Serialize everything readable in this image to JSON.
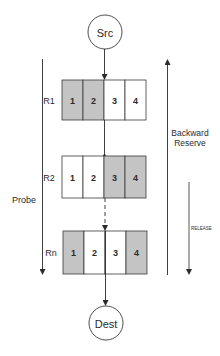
{
  "nodes": {
    "source": {
      "label": "Src"
    },
    "destination": {
      "label": "Dest"
    }
  },
  "routers": [
    {
      "label": "R1",
      "cells": [
        {
          "label": "1",
          "reserved": true
        },
        {
          "label": "2",
          "reserved": true
        },
        {
          "label": "3",
          "reserved": false
        },
        {
          "label": "4",
          "reserved": false
        }
      ]
    },
    {
      "label": "R2",
      "cells": [
        {
          "label": "1",
          "reserved": false
        },
        {
          "label": "2",
          "reserved": false
        },
        {
          "label": "3",
          "reserved": true
        },
        {
          "label": "4",
          "reserved": true
        }
      ]
    },
    {
      "label": "Rn",
      "cells": [
        {
          "label": "1",
          "reserved": true
        },
        {
          "label": "2",
          "reserved": false
        },
        {
          "label": "3",
          "reserved": false
        },
        {
          "label": "4",
          "reserved": true
        }
      ]
    }
  ],
  "arrows": {
    "probe": {
      "label": "Probe",
      "direction": "down"
    },
    "backward_reserve": {
      "label_line1": "Backward",
      "label_line2": "Reserve",
      "direction": "up"
    },
    "release": {
      "label": "RELEASE",
      "direction": "down"
    }
  },
  "colors": {
    "reserved_fill": "#c4c4c4",
    "free_fill": "#ffffff",
    "stroke": "#3a3a3a"
  }
}
